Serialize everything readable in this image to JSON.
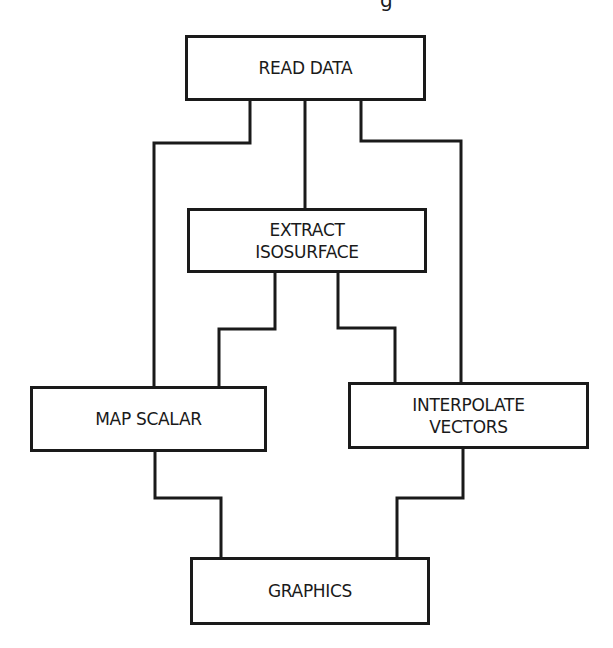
{
  "diagram": {
    "type": "flowchart",
    "caption_fragment": "g",
    "colors": {
      "line": "#1a1a1a",
      "background": "#ffffff"
    },
    "nodes": [
      {
        "id": "read_data",
        "label": "READ DATA",
        "x": 185,
        "y": 35,
        "w": 241,
        "h": 66
      },
      {
        "id": "extract_isosurface",
        "label": "EXTRACT\nISOSURFACE",
        "x": 187,
        "y": 208,
        "w": 240,
        "h": 65
      },
      {
        "id": "map_scalar",
        "label": "MAP SCALAR",
        "x": 30,
        "y": 386,
        "w": 237,
        "h": 66
      },
      {
        "id": "interpolate_vectors",
        "label": "INTERPOLATE\nVECTORS",
        "x": 348,
        "y": 382,
        "w": 241,
        "h": 67
      },
      {
        "id": "graphics",
        "label": "GRAPHICS",
        "x": 190,
        "y": 557,
        "w": 240,
        "h": 68
      }
    ],
    "edges": [
      {
        "from": "read_data",
        "to": "map_scalar",
        "points": [
          [
            250,
            101
          ],
          [
            250,
            143
          ],
          [
            154,
            143
          ],
          [
            154,
            386
          ]
        ]
      },
      {
        "from": "read_data",
        "to": "extract_isosurface",
        "points": [
          [
            305,
            101
          ],
          [
            305,
            208
          ]
        ]
      },
      {
        "from": "read_data",
        "to": "interpolate_vectors",
        "points": [
          [
            361,
            101
          ],
          [
            361,
            141
          ],
          [
            461,
            141
          ],
          [
            461,
            382
          ]
        ]
      },
      {
        "from": "extract_isosurface",
        "to": "map_scalar",
        "points": [
          [
            275,
            273
          ],
          [
            275,
            329
          ],
          [
            219,
            329
          ],
          [
            219,
            386
          ]
        ]
      },
      {
        "from": "extract_isosurface",
        "to": "interpolate_vectors",
        "points": [
          [
            338,
            273
          ],
          [
            338,
            328
          ],
          [
            395,
            328
          ],
          [
            395,
            382
          ]
        ]
      },
      {
        "from": "map_scalar",
        "to": "graphics",
        "points": [
          [
            155,
            452
          ],
          [
            155,
            498
          ],
          [
            221,
            498
          ],
          [
            221,
            557
          ]
        ]
      },
      {
        "from": "interpolate_vectors",
        "to": "graphics",
        "points": [
          [
            463,
            449
          ],
          [
            463,
            498
          ],
          [
            397,
            498
          ],
          [
            397,
            557
          ]
        ]
      }
    ]
  }
}
